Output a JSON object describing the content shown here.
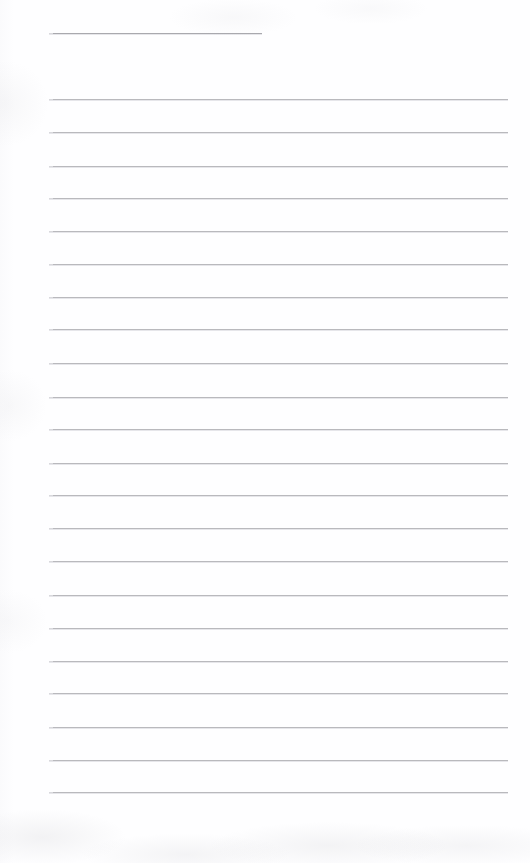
{
  "document": {
    "kind": "scanned-ruled-notepad-page",
    "title_text": "",
    "body_text": "",
    "page_width": 530,
    "page_height": 863,
    "background_color": "#fefeff",
    "rule_color": "#b9b9bd",
    "header_rule_color": "#a9a9ae",
    "is_blank": true
  },
  "layout": {
    "left_margin_x": 49,
    "right_margin_x": 508,
    "rule_spacing": 33.2,
    "rule_thickness": 1
  },
  "header_rule": {
    "name": "title-rule",
    "x_start": 49,
    "x_end": 262,
    "y": 33,
    "width": 213
  },
  "rules": [
    {
      "index": 1,
      "y": 99,
      "x_start": 49,
      "x_end": 508
    },
    {
      "index": 2,
      "y": 132,
      "x_start": 49,
      "x_end": 508
    },
    {
      "index": 3,
      "y": 166,
      "x_start": 49,
      "x_end": 508
    },
    {
      "index": 4,
      "y": 198,
      "x_start": 49,
      "x_end": 508
    },
    {
      "index": 5,
      "y": 231,
      "x_start": 49,
      "x_end": 508
    },
    {
      "index": 6,
      "y": 264,
      "x_start": 49,
      "x_end": 508
    },
    {
      "index": 7,
      "y": 297,
      "x_start": 49,
      "x_end": 508
    },
    {
      "index": 8,
      "y": 329,
      "x_start": 49,
      "x_end": 508
    },
    {
      "index": 9,
      "y": 363,
      "x_start": 49,
      "x_end": 508
    },
    {
      "index": 10,
      "y": 397,
      "x_start": 49,
      "x_end": 508
    },
    {
      "index": 11,
      "y": 429,
      "x_start": 49,
      "x_end": 508
    },
    {
      "index": 12,
      "y": 463,
      "x_start": 49,
      "x_end": 508
    },
    {
      "index": 13,
      "y": 495,
      "x_start": 49,
      "x_end": 508
    },
    {
      "index": 14,
      "y": 528,
      "x_start": 49,
      "x_end": 508
    },
    {
      "index": 15,
      "y": 561,
      "x_start": 49,
      "x_end": 508
    },
    {
      "index": 16,
      "y": 595,
      "x_start": 49,
      "x_end": 508
    },
    {
      "index": 17,
      "y": 628,
      "x_start": 49,
      "x_end": 508
    },
    {
      "index": 18,
      "y": 661,
      "x_start": 49,
      "x_end": 508
    },
    {
      "index": 19,
      "y": 693,
      "x_start": 49,
      "x_end": 508
    },
    {
      "index": 20,
      "y": 727,
      "x_start": 49,
      "x_end": 508
    },
    {
      "index": 21,
      "y": 760,
      "x_start": 49,
      "x_end": 508
    },
    {
      "index": 22,
      "y": 792,
      "x_start": 49,
      "x_end": 508
    }
  ]
}
